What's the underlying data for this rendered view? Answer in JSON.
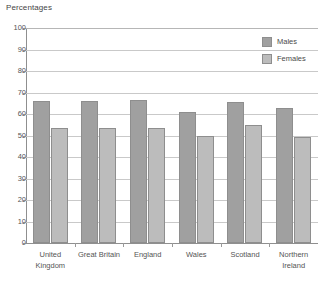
{
  "chart_data": {
    "type": "bar",
    "title": "Percentages",
    "xlabel": "",
    "ylabel": "",
    "ylim": [
      0,
      100
    ],
    "yticks": [
      0,
      10,
      20,
      30,
      40,
      50,
      60,
      70,
      80,
      90,
      100
    ],
    "ytick_labels": [
      "0",
      "10",
      "20",
      "30",
      "40",
      "50",
      "60",
      "70",
      "80",
      "90",
      "100"
    ],
    "grid": true,
    "legend_position": "top-right",
    "categories": [
      "United Kingdom",
      "Great Britain",
      "England",
      "Wales",
      "Scotland",
      "Northern Ireland"
    ],
    "category_lines": [
      [
        "United",
        "Kingdom"
      ],
      [
        "Great Britain",
        ""
      ],
      [
        "England",
        ""
      ],
      [
        "Wales",
        ""
      ],
      [
        "Scotland",
        ""
      ],
      [
        "Northern",
        "Ireland"
      ]
    ],
    "series": [
      {
        "name": "Males",
        "color": "#a0a0a0",
        "values": [
          66,
          66,
          66.5,
          61,
          65.5,
          63
        ]
      },
      {
        "name": "Females",
        "color": "#bcbcbc",
        "values": [
          53.5,
          53.5,
          53.5,
          50,
          55,
          49.5
        ]
      }
    ]
  },
  "legend": {
    "items": [
      {
        "label": "Males",
        "swatch": "males"
      },
      {
        "label": "Females",
        "swatch": "females"
      }
    ]
  },
  "colors": {
    "males": "#a0a0a0",
    "females": "#bcbcbc",
    "grid": "#c9c9c9",
    "axis": "#8f8f8f",
    "text": "#555555",
    "background": "#ffffff"
  }
}
